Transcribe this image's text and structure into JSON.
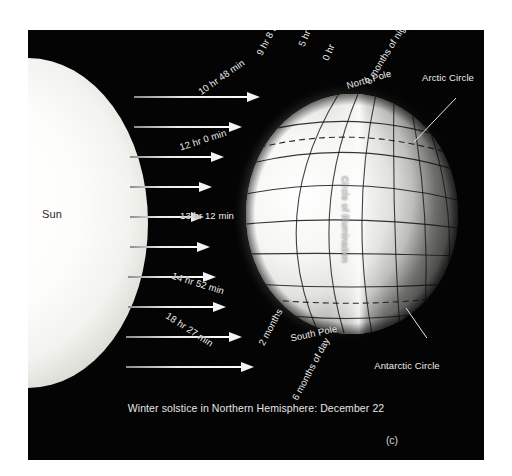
{
  "figure": {
    "caption": "Winter solstice in Northern Hemisphere: December 22",
    "panel_letter": "(c)",
    "background_color": "#040404",
    "label_color": "#efefef"
  },
  "sun": {
    "label": "Sun",
    "label_color": "#2a2a28"
  },
  "globe": {
    "terminator_label": "Circle of illumination",
    "north_pole_label": "North Pole",
    "south_pole_label": "South Pole",
    "arctic_circle_label": "Arctic Circle",
    "antarctic_circle_label": "Antarctic Circle",
    "six_months_night_label": "6 months of night",
    "six_months_day_label": "6 months of day",
    "two_months_label": "2 months"
  },
  "daylight_labels": [
    {
      "text": "0 hr",
      "rotation": -68
    },
    {
      "text": "5 hr 33 min",
      "rotation": -68
    },
    {
      "text": "9 hr 8 min",
      "rotation": -62
    },
    {
      "text": "10 hr 48 min",
      "rotation": -35
    },
    {
      "text": "12 hr 0 min",
      "rotation": -18
    },
    {
      "text": "13 hr 12 min",
      "rotation": 0
    },
    {
      "text": "14 hr 52 min",
      "rotation": 17
    },
    {
      "text": "18 hr 27 min",
      "rotation": 33
    }
  ],
  "sun_rays": [
    {
      "top": 62,
      "left": 106,
      "length": 126
    },
    {
      "top": 92,
      "left": 106,
      "length": 108
    },
    {
      "top": 122,
      "left": 102,
      "length": 94
    },
    {
      "top": 152,
      "left": 102,
      "length": 82
    },
    {
      "top": 182,
      "left": 102,
      "length": 74
    },
    {
      "top": 212,
      "left": 102,
      "length": 80
    },
    {
      "top": 242,
      "left": 100,
      "length": 88
    },
    {
      "top": 272,
      "left": 100,
      "length": 98
    },
    {
      "top": 302,
      "left": 98,
      "length": 116
    },
    {
      "top": 332,
      "left": 98,
      "length": 128
    }
  ],
  "chart_data": {
    "type": "diagram",
    "title": "Winter solstice in Northern Hemisphere: December 22",
    "categories": [
      "0 hr",
      "5 hr 33 min",
      "9 hr 8 min",
      "10 hr 48 min",
      "12 hr 0 min",
      "13 hr 12 min",
      "14 hr 52 min",
      "18 hr 27 min"
    ],
    "values": [
      0,
      5.55,
      9.13,
      10.8,
      12.0,
      13.2,
      14.87,
      18.45
    ],
    "xlabel": "Latitude band",
    "ylabel": "Hours of daylight",
    "ylim": [
      0,
      24
    ]
  }
}
